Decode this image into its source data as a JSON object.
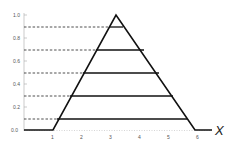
{
  "diagram": {
    "type": "trapezoidal-membership-function-alpha-cuts",
    "x_axis_label": "X",
    "y_ticks": [
      "0.0",
      "0.2",
      "0.4",
      "0.6",
      "0.8",
      "1.0"
    ],
    "x_ticks": [
      "1",
      "2",
      "3",
      "4",
      "5",
      "6"
    ],
    "alpha_cut_levels": [
      0.1,
      0.3,
      0.5,
      0.7,
      0.9
    ],
    "triangle": {
      "left": 1.0,
      "peak": 3.2,
      "right": 5.9,
      "height": 1.0
    },
    "colors": {
      "line": "#111111",
      "dashed": "#222222",
      "axis": "#999999",
      "text": "#555555"
    }
  }
}
